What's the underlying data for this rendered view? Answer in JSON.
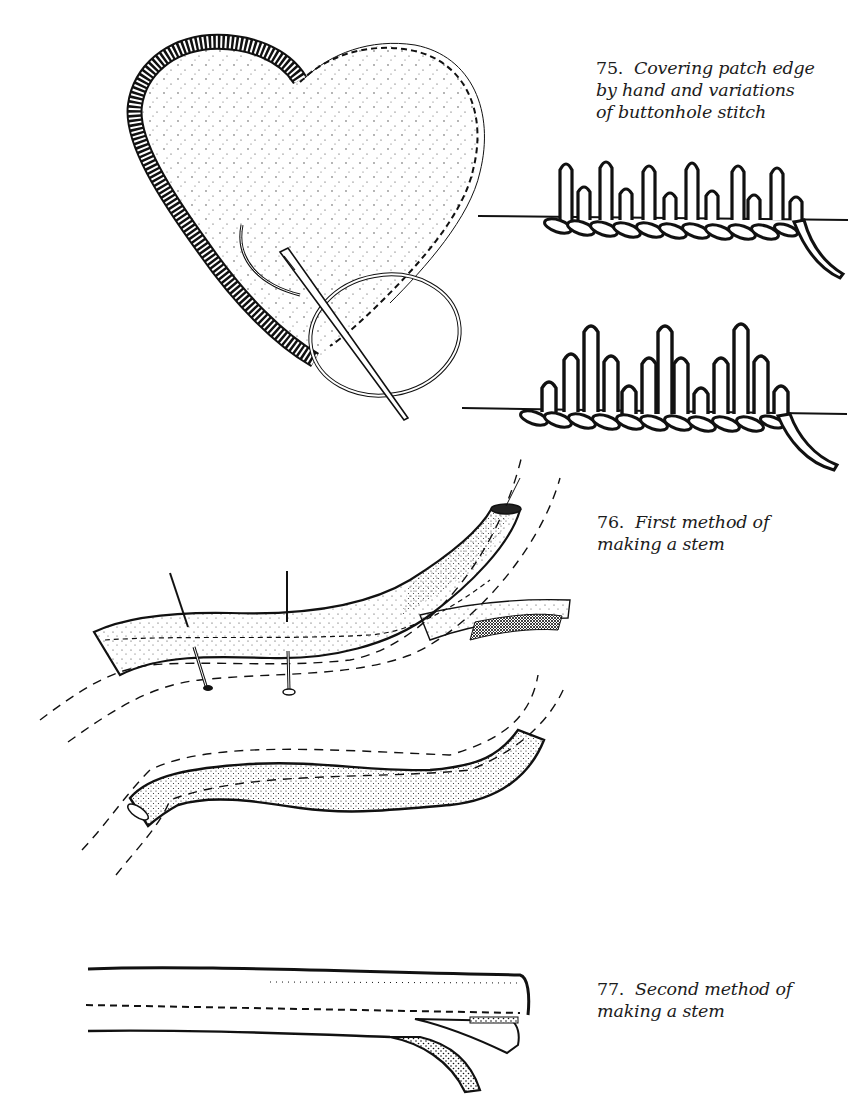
{
  "page": {
    "background": "#ffffff",
    "ink": "#111111"
  },
  "figures": [
    {
      "number": "75.",
      "caption_lines": [
        "Covering patch edge",
        "by hand and variations",
        "of buttonhole stitch"
      ],
      "illustrations": [
        "heart-patch-with-needle",
        "buttonhole-stitch-variation-1",
        "buttonhole-stitch-variation-2"
      ]
    },
    {
      "number": "76.",
      "caption_lines": [
        "First method of",
        "making a stem"
      ],
      "illustrations": [
        "pinned-bias-stem",
        "finished-curved-stem"
      ]
    },
    {
      "number": "77.",
      "caption_lines": [
        "Second method of",
        "making a stem"
      ],
      "illustrations": [
        "folded-straight-stem"
      ]
    }
  ]
}
